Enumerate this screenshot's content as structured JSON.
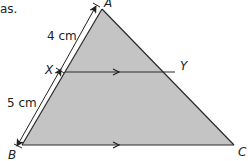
{
  "caption_fragment": "as.",
  "diagram": {
    "type": "triangle-with-parallel-line",
    "fill_color": "#c4c4c4",
    "stroke_color": "#2a2a2a",
    "vertices": {
      "A": {
        "label": "A",
        "x": 102,
        "y": 9
      },
      "B": {
        "label": "B",
        "x": 22,
        "y": 145
      },
      "C": {
        "label": "C",
        "x": 234,
        "y": 145
      }
    },
    "points": {
      "X": {
        "label": "X",
        "x": 65,
        "y": 72,
        "on": "AB"
      },
      "Y": {
        "label": "Y",
        "x": 175,
        "y": 72,
        "on": "AC"
      }
    },
    "parallel_segments": [
      "XY",
      "BC"
    ],
    "measurements": {
      "AX": {
        "label": "4 cm"
      },
      "XB": {
        "label": "5 cm"
      }
    }
  }
}
